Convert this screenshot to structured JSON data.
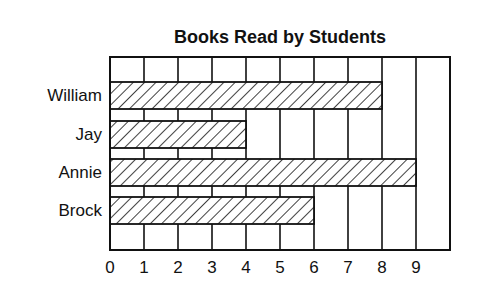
{
  "chart_data": {
    "type": "bar",
    "orientation": "horizontal",
    "title": "Books Read by Students",
    "xlabel": "",
    "ylabel": "",
    "categories": [
      "William",
      "Jay",
      "Annie",
      "Brock"
    ],
    "values": [
      8,
      4,
      9,
      6
    ],
    "xlim": [
      0,
      10
    ],
    "x_tick_labels": [
      "0",
      "1",
      "2",
      "3",
      "4",
      "5",
      "6",
      "7",
      "8",
      "9"
    ],
    "grid": true,
    "legend": null,
    "bar_fill": "diagonal-hatch",
    "colors": {
      "line": "#111111",
      "background": "#ffffff"
    }
  }
}
